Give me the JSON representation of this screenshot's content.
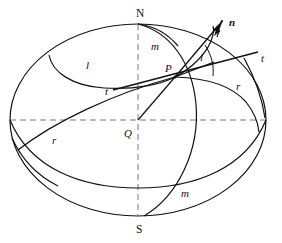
{
  "figure": {
    "kind": "sphere-geometry-diagram",
    "width": 282,
    "height": 243,
    "background_color": "#ffffff",
    "stroke_color": "#111111",
    "dash_color": "#666666"
  },
  "labels": {
    "north_pole": "N",
    "south_pole": "S",
    "centre": "Q",
    "surface_point": "P",
    "normal_vector": "n",
    "tangent_left": "t",
    "tangent_right": "t",
    "curve_l_left": "l",
    "curve_l_right": "l",
    "curve_r_left": "r",
    "curve_r_right": "r",
    "meridian_top": "m",
    "meridian_bottom": "m"
  },
  "label_positions": {
    "north_pole": {
      "x": 136,
      "y": 8
    },
    "south_pole": {
      "x": 136,
      "y": 224
    },
    "centre": {
      "x": 124,
      "y": 128
    },
    "surface_point": {
      "x": 165,
      "y": 63
    },
    "normal_vector": {
      "x": 229,
      "y": 17
    },
    "tangent_left": {
      "x": 105,
      "y": 86
    },
    "tangent_right": {
      "x": 261,
      "y": 53
    },
    "curve_l_left": {
      "x": 86,
      "y": 60
    },
    "curve_l_right": {
      "x": 200,
      "y": 52
    },
    "curve_r_left": {
      "x": 52,
      "y": 135
    },
    "curve_r_right": {
      "x": 236,
      "y": 81
    },
    "meridian_top": {
      "x": 151,
      "y": 41
    },
    "meridian_bottom": {
      "x": 181,
      "y": 188
    }
  },
  "geometry": {
    "ellipse_outline": {
      "cx": 138,
      "cy": 120,
      "rx": 128,
      "ry": 96
    },
    "equator_dashed_y": 120,
    "polar_axis_dashed": {
      "x": 138,
      "y_top": 24,
      "y_bottom": 216
    },
    "point_P": {
      "x": 175,
      "y": 77
    },
    "point_Q": {
      "x": 138,
      "y": 120
    },
    "normal_arrow_tip": {
      "x": 222,
      "y": 21
    }
  }
}
